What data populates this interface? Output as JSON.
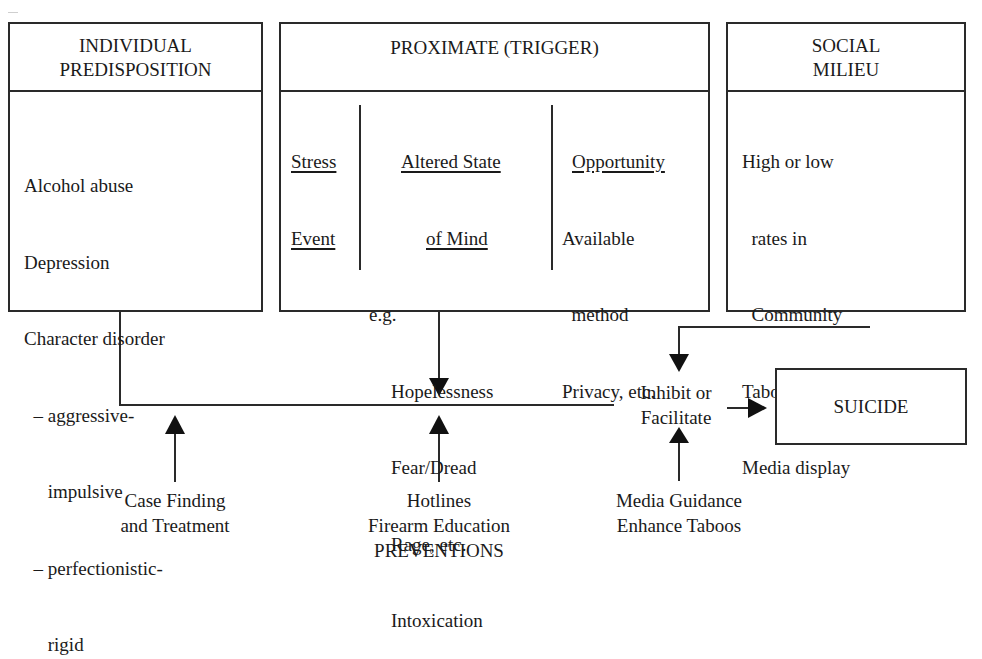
{
  "diagram": {
    "boxes": {
      "individual": {
        "title_line1": "INDIVIDUAL",
        "title_line2": "PREDISPOSITION",
        "items": [
          "Alcohol abuse",
          "Depression",
          "Character disorder",
          "  – aggressive-",
          "     impulsive",
          "  – perfectionistic-",
          "     rigid"
        ]
      },
      "proximate": {
        "title": "PROXIMATE (TRIGGER)",
        "columns": {
          "stress": {
            "heading_line1": "Stress",
            "heading_line2": "Event"
          },
          "altered": {
            "heading_line1": "Altered State",
            "heading_line2": "of Mind",
            "eg": "e.g.",
            "items": [
              "Hopelessness",
              "Fear/Dread",
              "Rage, etc.",
              "Intoxication"
            ]
          },
          "opportunity": {
            "heading": "Opportunity",
            "items": [
              "Available",
              "  method",
              "Privacy, etc."
            ]
          }
        }
      },
      "social": {
        "title_line1": "SOCIAL",
        "title_line2": "MILIEU",
        "items": [
          "High or low",
          "  rates in",
          "  Community",
          "Taboos",
          "Media display"
        ]
      },
      "outcome": {
        "label": "SUICIDE"
      }
    },
    "junction": {
      "line1": "Inhibit or",
      "line2": "Facilitate"
    },
    "interventions": {
      "individual": {
        "line1": "Case Finding",
        "line2": "and Treatment"
      },
      "proximate": {
        "line1": "Hotlines",
        "line2": "Firearm Education",
        "line3": "PREVENTIONS"
      },
      "social": {
        "line1": "Media Guidance",
        "line2": "Enhance Taboos"
      }
    },
    "colors": {
      "line": "#2a2a2a",
      "text": "#1a1a1a",
      "background": "#ffffff"
    }
  }
}
